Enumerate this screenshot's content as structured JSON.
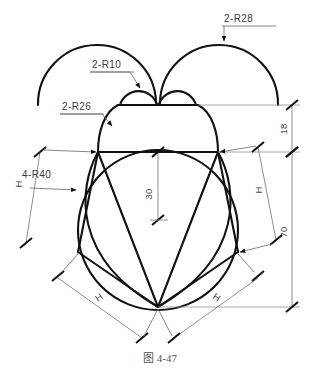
{
  "figure": {
    "caption": "图 4-47"
  },
  "radius_labels": [
    {
      "id": "r28",
      "text": "2-R28",
      "x": 224,
      "y": 22,
      "underline_x1": 222,
      "underline_x2": 276,
      "underline_y": 26
    },
    {
      "id": "r10",
      "text": "2-R10",
      "x": 92,
      "y": 68,
      "underline_x1": 90,
      "underline_x2": 134,
      "underline_y": 72
    },
    {
      "id": "r26",
      "text": "2-R26",
      "x": 62,
      "y": 110,
      "underline_x1": 60,
      "underline_x2": 104,
      "underline_y": 114
    },
    {
      "id": "r40",
      "text": "4-R40",
      "x": 22,
      "y": 174,
      "underline_x1": 0,
      "underline_x2": 0,
      "underline_y": 0
    }
  ],
  "linear_dims": [
    {
      "id": "dim-18",
      "text": "18",
      "x": 289,
      "y": 127,
      "rotated": true
    },
    {
      "id": "dim-70",
      "text": "70",
      "x": 289,
      "y": 232,
      "rotated": true
    },
    {
      "id": "dim-30",
      "text": "30",
      "x": 145,
      "y": 194,
      "rotated": true
    }
  ],
  "h_dims": [
    {
      "id": "h-left-upper",
      "text": "H",
      "x": 20,
      "y": 184,
      "rotate": -90
    },
    {
      "id": "h-right-upper",
      "text": "H",
      "x": 262,
      "y": 190,
      "rotate": -90
    },
    {
      "id": "h-bottom-left",
      "text": "H",
      "x": 103,
      "y": 300,
      "rotate": -34
    },
    {
      "id": "h-bottom-right",
      "text": "H",
      "x": 213,
      "y": 300,
      "rotate": 34
    }
  ],
  "colors": {
    "outline": "#111111",
    "dimension": "#7a7a7a",
    "text": "#3a3a3a",
    "background": "#ffffff"
  },
  "geometry": {
    "center_x": 158,
    "neck_y": 105,
    "shoulder_y": 152,
    "apex_y": 307,
    "left_shoulder_x": 98,
    "right_shoulder_x": 218,
    "left_wing_x": 78,
    "right_wing_x": 238,
    "wing_y": 252
  }
}
